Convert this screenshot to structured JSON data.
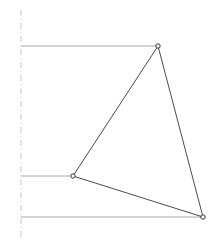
{
  "figure": {
    "type": "technical-line-drawing",
    "canvas": {
      "width": 219,
      "height": 246,
      "background_color": "#ffffff"
    },
    "colors": {
      "triangle_edge": "#4a4a4a",
      "projection_line": "#a8a8a8",
      "centerline": "#c8c8c8",
      "vertex_marker_stroke": "#333333",
      "vertex_marker_fill": "#ffffff"
    },
    "centerline": {
      "name": "vertical-centerline",
      "x": 21,
      "y_start": 10,
      "y_end": 237,
      "stroke_width": 1,
      "dash_pattern": "6 3 1 3",
      "color": "#c8c8c8"
    },
    "projection_lines": [
      {
        "name": "top-projection-line",
        "x1": 21,
        "y1": 46,
        "x2": 158,
        "y2": 46,
        "color": "#a8a8a8",
        "stroke_width": 1
      },
      {
        "name": "middle-projection-line",
        "x1": 21,
        "y1": 176,
        "x2": 73,
        "y2": 176,
        "color": "#a8a8a8",
        "stroke_width": 1
      },
      {
        "name": "bottom-projection-line",
        "x1": 21,
        "y1": 217,
        "x2": 203,
        "y2": 217,
        "color": "#a8a8a8",
        "stroke_width": 1
      }
    ],
    "triangle": {
      "name": "triangle-polygon",
      "points": "158,46 73,176 203,217",
      "stroke": "#4a4a4a",
      "stroke_width": 1,
      "fill": "none"
    },
    "vertices": [
      {
        "name": "vertex-apex",
        "x": 158,
        "y": 46,
        "radius": 2.2
      },
      {
        "name": "vertex-mid-left",
        "x": 73,
        "y": 176,
        "radius": 2.2
      },
      {
        "name": "vertex-bottom-right",
        "x": 203,
        "y": 217,
        "radius": 2.2
      }
    ]
  }
}
